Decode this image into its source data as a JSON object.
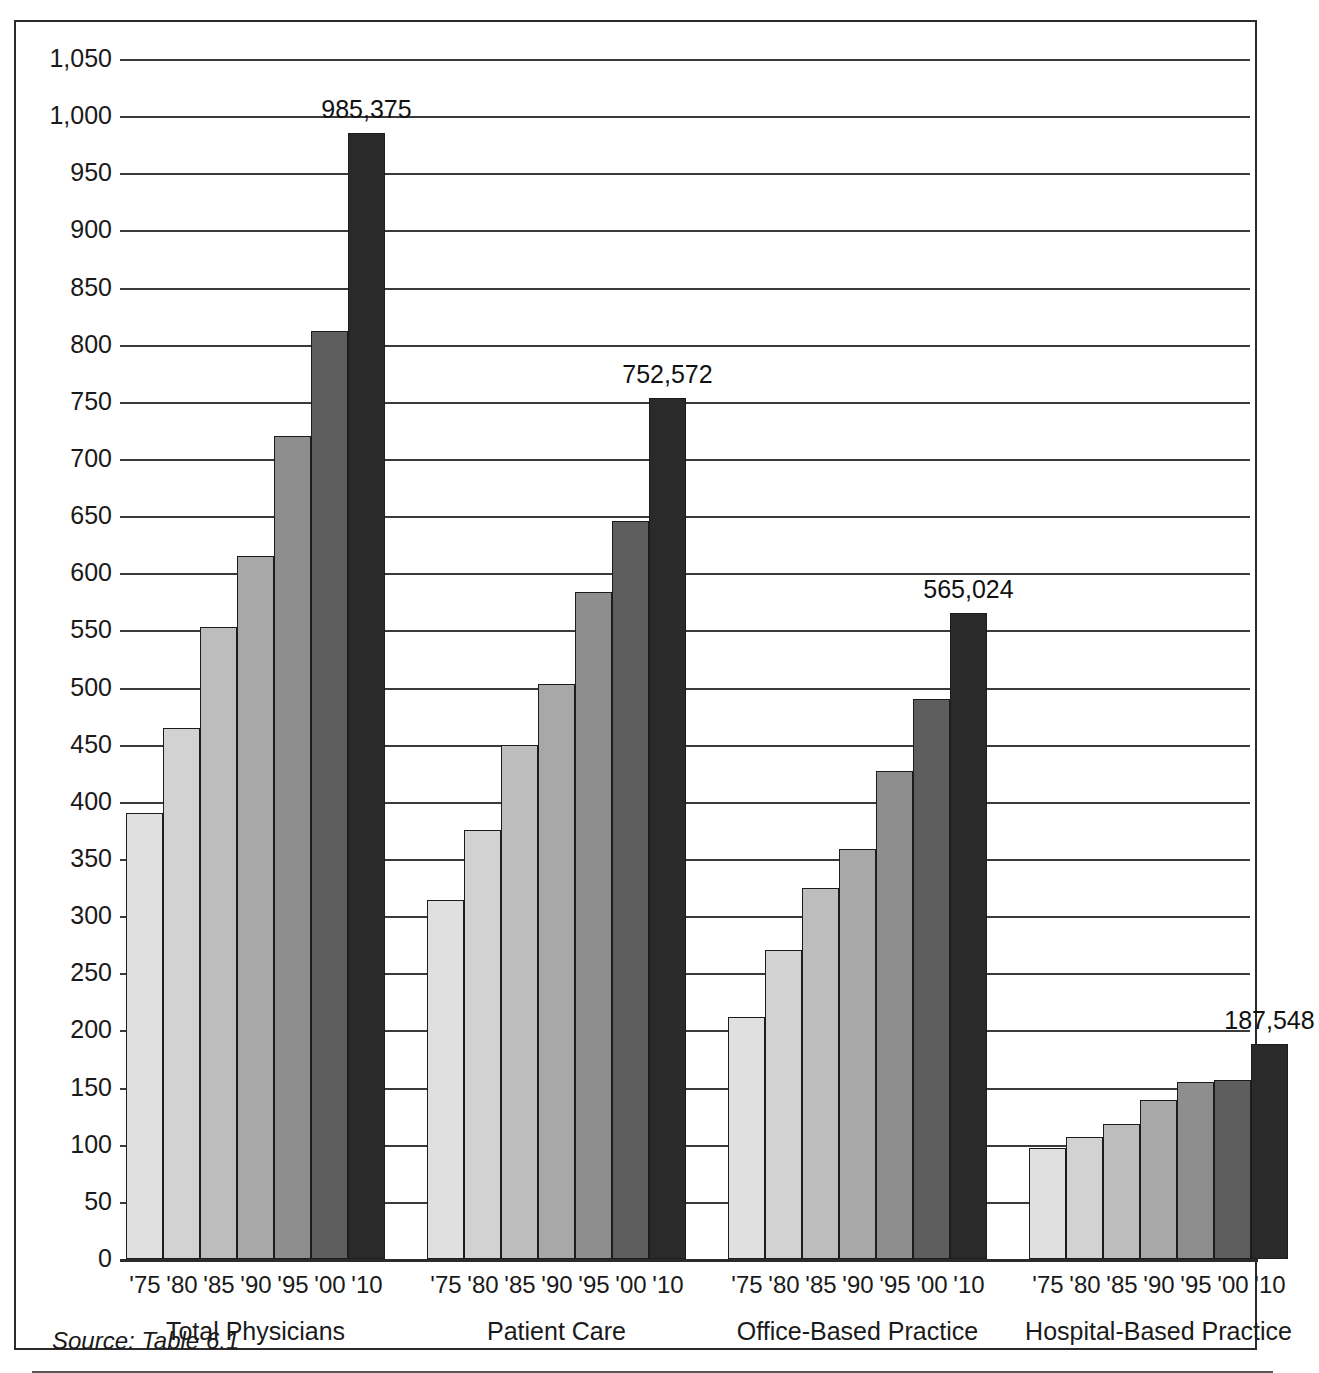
{
  "source_note": "Source: Table 6.1",
  "chart_data": {
    "type": "bar",
    "title": "",
    "subtitle": "",
    "xlabel": "",
    "ylabel": "",
    "ylim": [
      0,
      1050
    ],
    "ytick_step": 50,
    "grid": true,
    "legend": "none",
    "units": "thousands of physicians",
    "categories": [
      "'75",
      "'80",
      "'85",
      "'90",
      "'95",
      "'00",
      "'10"
    ],
    "ytick_labels": [
      "0",
      "50",
      "100",
      "150",
      "200",
      "250",
      "300",
      "350",
      "400",
      "450",
      "500",
      "550",
      "600",
      "650",
      "700",
      "750",
      "800",
      "850",
      "900",
      "950",
      "1,000",
      "1,050"
    ],
    "ytick_values": [
      0,
      50,
      100,
      150,
      200,
      250,
      300,
      350,
      400,
      450,
      500,
      550,
      600,
      650,
      700,
      750,
      800,
      850,
      900,
      950,
      1000,
      1050
    ],
    "bar_colors": [
      "#e0e0e0",
      "#d2d2d2",
      "#bdbdbd",
      "#a8a8a8",
      "#8e8e8e",
      "#5e5e5e",
      "#2a2a2a"
    ],
    "groups": [
      {
        "name": "Total Physicians",
        "label": "Total Physicians",
        "values": [
          390,
          465,
          553,
          615,
          720,
          812,
          985
        ],
        "annotation": "985,375",
        "annotation_value": 985375
      },
      {
        "name": "Patient Care",
        "label": "Patient Care",
        "values": [
          314,
          375,
          450,
          503,
          584,
          646,
          753
        ],
        "annotation": "752,572",
        "annotation_value": 752572
      },
      {
        "name": "Office-Based Practice",
        "label": "Office-Based Practice",
        "values": [
          212,
          270,
          325,
          359,
          427,
          490,
          565
        ],
        "annotation": "565,024",
        "annotation_value": 565024
      },
      {
        "name": "Hospital-Based Practice",
        "label": "Hospital-Based Practice",
        "values": [
          97,
          107,
          118,
          139,
          155,
          157,
          188
        ],
        "annotation": "187,548",
        "annotation_value": 187548
      }
    ]
  }
}
